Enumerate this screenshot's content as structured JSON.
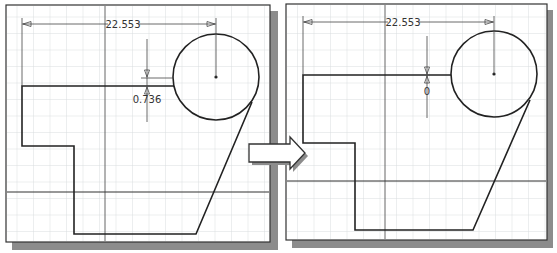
{
  "figure": {
    "arrow": "right-arrow"
  },
  "panels": [
    {
      "id": "before",
      "horizontal_dimension": "22.553",
      "vertical_dimension": "0.736"
    },
    {
      "id": "after",
      "horizontal_dimension": "22.553",
      "vertical_dimension": "0"
    }
  ],
  "colors": {
    "background": "#ffffff",
    "grid": "#d9dde0",
    "frame": "#333333",
    "shadow": "#8c8c8c",
    "geometry": "#222222",
    "dimension": "#444444"
  }
}
